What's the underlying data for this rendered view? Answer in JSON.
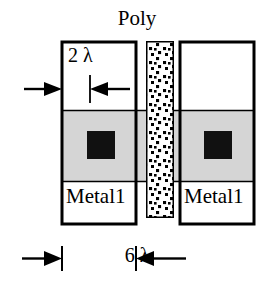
{
  "diagram": {
    "labels": {
      "poly": "Poly",
      "metal_left": "Metal1",
      "metal_right": "Metal1",
      "dim_top": "2 λ",
      "dim_bottom": "6 λ"
    },
    "colors": {
      "outline": "#000000",
      "diffusion_fill": "#d5d5d5",
      "contact_fill": "#111111",
      "poly_fill": "#ffffff",
      "poly_dot": "#000000",
      "background": "#ffffff"
    },
    "geometry": {
      "metal_left_box": {
        "x": 62,
        "y": 42,
        "w": 74,
        "h": 182
      },
      "metal_right_box": {
        "x": 180,
        "y": 42,
        "w": 74,
        "h": 182
      },
      "poly_stripe": {
        "x": 146,
        "y": 41,
        "w": 28,
        "h": 177
      },
      "diffusion_band": {
        "x": 62,
        "y": 110,
        "w": 192,
        "h": 72
      },
      "contact_left": {
        "x": 87,
        "y": 131,
        "w": 28,
        "h": 28
      },
      "contact_right": {
        "x": 204,
        "y": 131,
        "w": 28,
        "h": 28
      }
    },
    "dimensions": [
      {
        "name": "poly-to-metal-spacing",
        "value": "2 λ",
        "orientation": "horizontal",
        "y": 89
      },
      {
        "name": "metal-width",
        "value": "6 λ",
        "orientation": "horizontal",
        "y": 258
      }
    ]
  }
}
